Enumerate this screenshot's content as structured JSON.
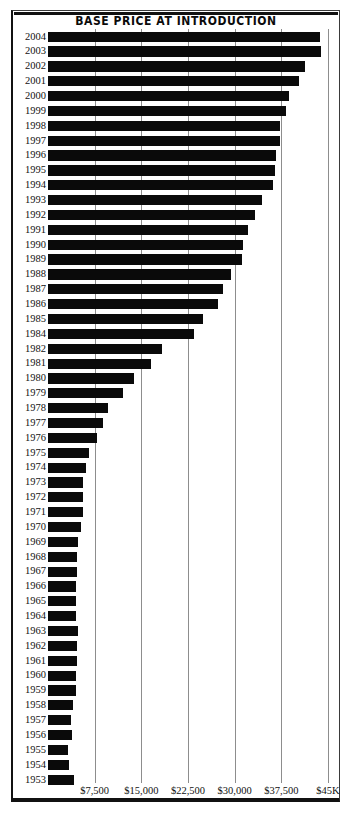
{
  "chart_data": {
    "type": "bar",
    "orientation": "horizontal",
    "title": "BASE PRICE AT INTRODUCTION",
    "xlabel": "",
    "ylabel": "",
    "xlim": [
      0,
      45000
    ],
    "grid": "vertical",
    "legend": "none",
    "xticks": [
      {
        "value": 7500,
        "label": "$7,500"
      },
      {
        "value": 15000,
        "label": "$15,000"
      },
      {
        "value": 22500,
        "label": "$22,500"
      },
      {
        "value": 30000,
        "label": "$30,000"
      },
      {
        "value": 37500,
        "label": "$37,500"
      },
      {
        "value": 45000,
        "label": "$45K"
      }
    ],
    "categories": [
      "2004",
      "2003",
      "2002",
      "2001",
      "2000",
      "1999",
      "1998",
      "1997",
      "1996",
      "1995",
      "1994",
      "1993",
      "1992",
      "1991",
      "1990",
      "1989",
      "1988",
      "1987",
      "1986",
      "1985",
      "1984",
      "1982",
      "1981",
      "1980",
      "1979",
      "1978",
      "1977",
      "1976",
      "1975",
      "1974",
      "1973",
      "1972",
      "1971",
      "1970",
      "1969",
      "1968",
      "1967",
      "1966",
      "1965",
      "1964",
      "1963",
      "1962",
      "1961",
      "1960",
      "1959",
      "1958",
      "1957",
      "1956",
      "1955",
      "1954",
      "1953"
    ],
    "values": [
      43700,
      43900,
      41300,
      40400,
      38700,
      38300,
      37300,
      37300,
      36700,
      36500,
      36100,
      34400,
      33200,
      32100,
      31300,
      31200,
      29400,
      28200,
      27400,
      24900,
      23400,
      18300,
      16500,
      13900,
      12100,
      9600,
      8800,
      7800,
      6600,
      6100,
      5600,
      5600,
      5600,
      5300,
      4900,
      4600,
      4600,
      4500,
      4500,
      4500,
      4800,
      4600,
      4600,
      4500,
      4500,
      4000,
      3700,
      3900,
      3200,
      3400,
      4200
    ]
  }
}
